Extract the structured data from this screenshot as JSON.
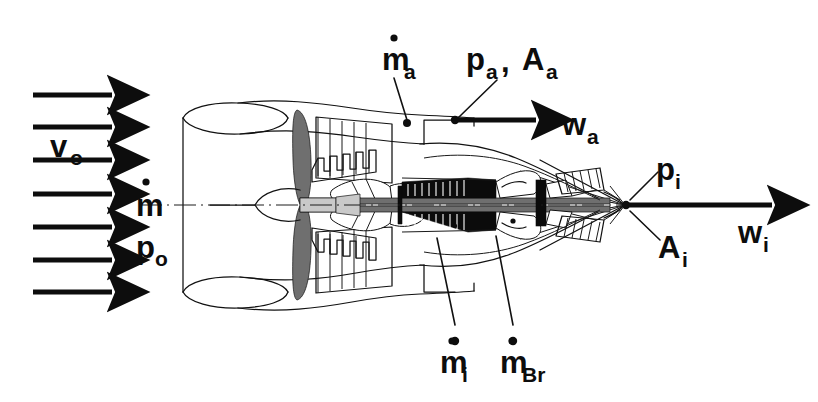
{
  "figure": {
    "background_color": "#ffffff",
    "ink_color": "#0d0d0d",
    "width": 818,
    "height": 402
  },
  "labels": {
    "freestream_velocity": {
      "base": "v",
      "sub": "o",
      "dot": false
    },
    "freestream_massflow": {
      "base": "m",
      "sub": "",
      "dot": true
    },
    "freestream_pressure": {
      "base": "p",
      "sub": "o",
      "dot": false
    },
    "bypass_massflow": {
      "base": "m",
      "sub": "a",
      "dot": true
    },
    "bypass_pressure": {
      "base": "p",
      "sub": "a",
      "dot": false
    },
    "bypass_area": {
      "base": "A",
      "sub": "a",
      "dot": false
    },
    "bypass_separator": ",",
    "bypass_velocity": {
      "base": "w",
      "sub": "a",
      "dot": false
    },
    "core_pressure": {
      "base": "p",
      "sub": "i",
      "dot": false
    },
    "core_area": {
      "base": "A",
      "sub": "i",
      "dot": false
    },
    "core_velocity": {
      "base": "w",
      "sub": "i",
      "dot": false
    },
    "core_massflow": {
      "base": "m",
      "sub": "i",
      "dot": true
    },
    "fuel_massflow": {
      "base": "m",
      "sub": "Br",
      "dot": true
    }
  },
  "inlet_flow_arrows": {
    "count": 7,
    "x_start": 33,
    "x_end": 118,
    "y_positions": [
      95,
      127,
      160,
      194,
      227,
      260,
      292
    ]
  },
  "outlet_flow_arrows": [
    {
      "name": "bypass-exit-arrow",
      "x_start": 455,
      "x_end": 546,
      "y": 120
    },
    {
      "name": "core-exit-arrow",
      "x_start": 628,
      "x_end": 782,
      "y": 205
    }
  ],
  "geometry": {
    "centerline_y": 205,
    "nacelle_left_x": 183,
    "nacelle_right_x": 625,
    "core_apex_x": 625,
    "core_apex_y": 205
  },
  "annotation_points": [
    {
      "name": "bypass-massflow-dot",
      "x": 407,
      "y": 123
    },
    {
      "name": "bypass-station-dot",
      "x": 455,
      "y": 120
    },
    {
      "name": "core-station-dot",
      "x": 626,
      "y": 205
    },
    {
      "name": "core-massflow-dot",
      "x": 455,
      "y": 341
    },
    {
      "name": "fuel-massflow-dot",
      "x": 513,
      "y": 341
    }
  ]
}
